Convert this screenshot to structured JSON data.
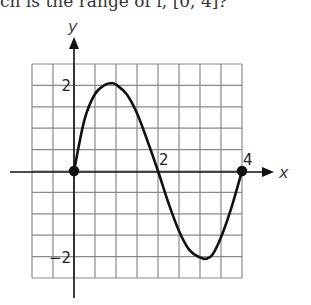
{
  "question": {
    "text": "ch is the range of f, [0, 4]?"
  },
  "chart_data": {
    "type": "line",
    "title": "",
    "xlabel": "x",
    "ylabel": "y",
    "xlim": [
      -1,
      4
    ],
    "ylim": [
      -2.5,
      2.5
    ],
    "grid": true,
    "grid_step": 0.5,
    "x_tick_labels": [
      {
        "value": 2,
        "label": "2"
      },
      {
        "value": 4,
        "label": "4"
      }
    ],
    "y_tick_labels": [
      {
        "value": 2,
        "label": "2"
      },
      {
        "value": -2,
        "label": "-2"
      }
    ],
    "series": [
      {
        "name": "f(x)",
        "x": [
          0,
          0.25,
          0.5,
          0.75,
          0.9,
          1.0,
          1.25,
          1.5,
          1.75,
          2.0,
          2.25,
          2.5,
          2.75,
          3.0,
          3.15,
          3.3,
          3.5,
          3.75,
          4.0
        ],
        "y": [
          0,
          1.2,
          1.8,
          2.02,
          2.05,
          2.02,
          1.8,
          1.35,
          0.7,
          0,
          -0.75,
          -1.4,
          -1.85,
          -2.02,
          -2.05,
          -1.95,
          -1.55,
          -0.85,
          0
        ]
      }
    ],
    "endpoints": [
      {
        "x": 0,
        "y": 0,
        "closed": true
      },
      {
        "x": 4,
        "y": 0,
        "closed": true
      }
    ],
    "annotations": []
  }
}
